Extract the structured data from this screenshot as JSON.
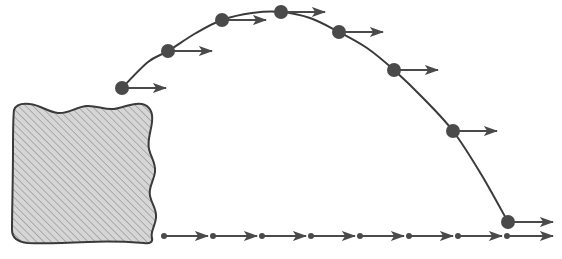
{
  "figure": {
    "width": 562,
    "height": 259,
    "background_color": "#ffffff"
  },
  "style": {
    "stroke_color": "#3a3a3a",
    "marker_color": "#4a4a4a",
    "arrow_color": "#4a4a4a",
    "block_fill_color": "#d6d6d6",
    "block_hatch_color": "#9a9a9a",
    "block_outline_color": "#3a3a3a",
    "marker_radius": 7,
    "small_marker_radius": 3,
    "curve_stroke_width": 2,
    "arrow_stroke_width": 2
  },
  "chart_data": {
    "type": "scatter",
    "title": "",
    "xlabel": "",
    "ylabel": "",
    "xlim": [
      0,
      562
    ],
    "ylim": [
      259,
      0
    ],
    "grid": false,
    "legend": null,
    "annotations": [],
    "trajectory": {
      "name": "projectile-path",
      "description": "parabolic arc rising from launch point, peaking near x=281, then descending to ground level",
      "path_points": [
        [
          122,
          88
        ],
        [
          148,
          62
        ],
        [
          168,
          51
        ],
        [
          196,
          33
        ],
        [
          222,
          20
        ],
        [
          252,
          13
        ],
        [
          281,
          12
        ],
        [
          310,
          18
        ],
        [
          339,
          32
        ],
        [
          367,
          48
        ],
        [
          394,
          70
        ],
        [
          424,
          99
        ],
        [
          453,
          131
        ],
        [
          481,
          174
        ],
        [
          508,
          222
        ]
      ]
    },
    "markers": {
      "name": "velocity-sample-points",
      "x": [
        122,
        168,
        222,
        281,
        339,
        394,
        453,
        508
      ],
      "y": [
        88,
        51,
        20,
        12,
        32,
        70,
        131,
        222
      ]
    },
    "velocity_vectors": {
      "name": "horizontal-velocity-vectors",
      "direction": "horizontal-right",
      "note": "all vectors equal length, showing constant horizontal velocity component",
      "items": [
        {
          "x0": 122,
          "y": 88,
          "x1": 166
        },
        {
          "x0": 168,
          "y": 51,
          "x1": 212
        },
        {
          "x0": 222,
          "y": 20,
          "x1": 266
        },
        {
          "x0": 281,
          "y": 12,
          "x1": 325
        },
        {
          "x0": 339,
          "y": 32,
          "x1": 383
        },
        {
          "x0": 394,
          "y": 70,
          "x1": 438
        },
        {
          "x0": 453,
          "y": 131,
          "x1": 497
        },
        {
          "x0": 508,
          "y": 222,
          "x1": 553
        }
      ]
    },
    "ground_vectors": {
      "name": "ground-level-velocity-vectors",
      "y": 236,
      "note": "row of equal horizontal vectors along the ground indicating uniform horizontal motion",
      "items": [
        {
          "x0": 164,
          "x1": 208
        },
        {
          "x0": 213,
          "x1": 257
        },
        {
          "x0": 262,
          "x1": 306
        },
        {
          "x0": 311,
          "x1": 355
        },
        {
          "x0": 360,
          "x1": 404
        },
        {
          "x0": 409,
          "x1": 453
        },
        {
          "x0": 458,
          "x1": 502
        },
        {
          "x0": 507,
          "x1": 553
        }
      ]
    },
    "block": {
      "name": "hatched-cliff-block",
      "description": "irregular hatched rectangular block at lower-left representing a cliff or launch platform",
      "bounds": {
        "x": 10,
        "y": 102,
        "width": 150,
        "height": 142
      },
      "outline_path": "M 14,110 C 16,104 22,103 30,104 C 40,105 48,112 58,113 C 68,114 76,107 86,106 C 96,105 104,110 114,109 C 124,108 132,102 142,104 C 150,106 153,113 152,122 C 151,132 147,140 149,149 C 151,158 156,163 155,172 C 154,181 148,187 150,196 C 152,205 157,209 156,218 C 155,227 150,232 152,238 C 153,242 150,244 144,243 C 130,242 110,241 88,242 C 66,243 44,244 28,243 C 18,242 12,238 12,230 C 12,210 13,180 13,150 C 13,130 13,118 14,110 Z"
    }
  }
}
